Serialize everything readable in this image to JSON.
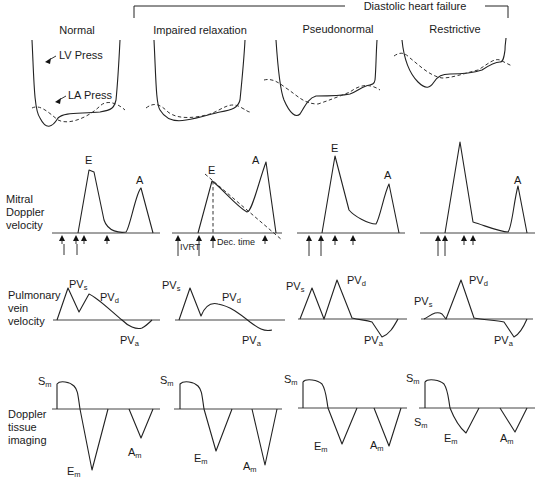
{
  "header": {
    "group_label": "Diastolic heart failure",
    "columns": [
      "Normal",
      "Impaired relaxation",
      "Pseudonormal",
      "Restrictive"
    ]
  },
  "pressure_row": {
    "lv_label": "LV Press",
    "la_label": "LA Press"
  },
  "mitral_row": {
    "label_lines": [
      "Mitral",
      "Doppler",
      "velocity"
    ],
    "peak_e": "E",
    "peak_a": "A",
    "ivrt_label": "IVRT",
    "dec_time_label": "Dec. time"
  },
  "pulmonary_row": {
    "label_lines": [
      "Pulmonary",
      "vein",
      "velocity"
    ],
    "pv_main": "PV",
    "sub_s": "s",
    "sub_d": "d",
    "sub_a": "a"
  },
  "tissue_row": {
    "label_lines": [
      "Doppler",
      "tissue",
      "imaging"
    ],
    "s_main": "S",
    "e_main": "E",
    "a_main": "A",
    "sub_m": "m"
  },
  "colors": {
    "line": "#222222",
    "background": "#ffffff"
  }
}
